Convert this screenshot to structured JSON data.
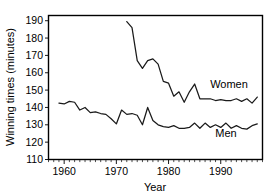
{
  "chart_data": {
    "type": "line",
    "title": "",
    "xlabel": "Year",
    "ylabel": "Winning times (minutes)",
    "xlim": [
      1957,
      1998
    ],
    "ylim": [
      110,
      193
    ],
    "grid": false,
    "legend_position": "inline-right",
    "x_ticks": [
      1960,
      1970,
      1980,
      1990
    ],
    "x_tick_labels": [
      "1960",
      "1970",
      "1980",
      "1990"
    ],
    "x_minor_tick_step": 1,
    "y_ticks": [
      110,
      120,
      130,
      140,
      150,
      160,
      170,
      180,
      190
    ],
    "y_tick_labels": [
      "110",
      "120",
      "130",
      "140",
      "150",
      "160",
      "170",
      "180",
      "190"
    ],
    "series": [
      {
        "name": "Women",
        "label": "Women",
        "color": "#1a1a1a",
        "x": [
          1972,
          1973,
          1974,
          1975,
          1976,
          1977,
          1978,
          1979,
          1980,
          1981,
          1982,
          1983,
          1984,
          1985,
          1986,
          1987,
          1988,
          1989,
          1990,
          1991,
          1992,
          1993,
          1994,
          1995,
          1996,
          1997
        ],
        "values": [
          189.5,
          186.0,
          167.0,
          162.5,
          167.0,
          168.0,
          165.0,
          155.0,
          154.0,
          146.5,
          149.0,
          143.0,
          149.0,
          153.5,
          145.0,
          145.0,
          145.0,
          144.0,
          144.5,
          144.0,
          144.0,
          145.0,
          143.5,
          145.0,
          142.5,
          146.0
        ]
      },
      {
        "name": "Men",
        "label": "Men",
        "color": "#1a1a1a",
        "x": [
          1959,
          1960,
          1961,
          1962,
          1963,
          1964,
          1965,
          1966,
          1967,
          1968,
          1969,
          1970,
          1971,
          1972,
          1973,
          1974,
          1975,
          1976,
          1977,
          1978,
          1979,
          1980,
          1981,
          1982,
          1983,
          1984,
          1985,
          1986,
          1987,
          1988,
          1989,
          1990,
          1991,
          1992,
          1993,
          1994,
          1995,
          1996,
          1997
        ],
        "values": [
          142.5,
          142.0,
          143.5,
          143.0,
          138.5,
          140.0,
          137.0,
          137.5,
          136.5,
          136.0,
          133.5,
          130.5,
          138.5,
          136.0,
          136.5,
          135.5,
          130.0,
          140.0,
          132.5,
          130.0,
          129.0,
          128.5,
          129.5,
          128.0,
          128.0,
          128.5,
          131.0,
          128.0,
          131.0,
          128.5,
          130.0,
          128.5,
          131.0,
          128.0,
          129.5,
          128.0,
          127.5,
          129.5,
          130.5
        ]
      }
    ]
  },
  "annotations": {
    "women_label": "Women",
    "men_label": "Men"
  }
}
